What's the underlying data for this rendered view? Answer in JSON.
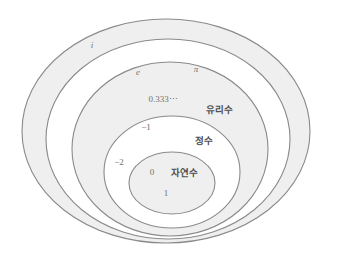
{
  "diagram": {
    "kind": "nested-ellipses-number-sets",
    "background_color": "#ffffff",
    "band_fill_color": "#efefef",
    "inner_fill_color": "#ffffff",
    "stroke_color": "#8a8a8a",
    "label_color": "#6f6f6f",
    "setname_color": "#4e4e4e",
    "sets": [
      {
        "id": "complex",
        "name": "",
        "fill": "#efefef",
        "cx": 166,
        "cy": 131,
        "rx": 144,
        "ry": 112
      },
      {
        "id": "real",
        "name": "",
        "fill": "#ffffff",
        "cx": 168,
        "cy": 139,
        "rx": 122,
        "ry": 100
      },
      {
        "id": "rational",
        "name": "유리수",
        "fill": "#efefef",
        "cx": 170,
        "cy": 149,
        "rx": 98,
        "ry": 87
      },
      {
        "id": "integer",
        "name": "정수",
        "fill": "#ffffff",
        "cx": 172,
        "cy": 172,
        "rx": 68,
        "ry": 56
      },
      {
        "id": "natural",
        "name": "자연수",
        "fill": "#efefef",
        "cx": 172,
        "cy": 183,
        "rx": 43,
        "ry": 31
      }
    ],
    "element_labels": [
      {
        "id": "imaginary-unit-i",
        "text": "i",
        "x": 92,
        "y": 48,
        "italic": true
      },
      {
        "id": "eulers-number-e",
        "text": "e",
        "x": 138,
        "y": 75,
        "italic": true
      },
      {
        "id": "pi",
        "text": "π",
        "x": 196,
        "y": 72,
        "italic": true
      },
      {
        "id": "repeating-third",
        "text": "0.333⋯",
        "x": 163,
        "y": 102,
        "italic": false
      },
      {
        "id": "negative-one",
        "text": "−1",
        "x": 146,
        "y": 130,
        "italic": false
      },
      {
        "id": "negative-two",
        "text": "−2",
        "x": 119,
        "y": 165,
        "italic": false
      },
      {
        "id": "zero",
        "text": "0",
        "x": 152,
        "y": 175,
        "italic": false
      },
      {
        "id": "one",
        "text": "1",
        "x": 166,
        "y": 196,
        "italic": false
      }
    ],
    "set_name_labels": [
      {
        "id": "rational-set-name",
        "text": "유리수",
        "x": 219,
        "y": 113
      },
      {
        "id": "integer-set-name",
        "text": "정수",
        "x": 204,
        "y": 144
      },
      {
        "id": "natural-set-name",
        "text": "자연수",
        "x": 184,
        "y": 176
      }
    ]
  }
}
